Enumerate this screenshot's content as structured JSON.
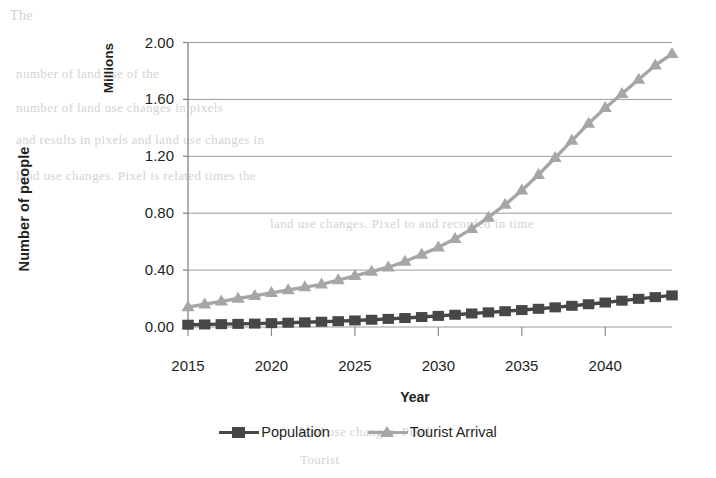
{
  "chart_data": {
    "type": "line",
    "title": "",
    "xlabel": "Year",
    "ylabel": "Number of people",
    "y_unit_label": "Millions",
    "xlim": [
      2015,
      2044
    ],
    "ylim": [
      0.0,
      2.0
    ],
    "grid": true,
    "legend_position": "bottom",
    "xticks": [
      2015,
      2020,
      2025,
      2030,
      2035,
      2040
    ],
    "xtick_labels": [
      "2015",
      "2020",
      "2025",
      "2030",
      "2035",
      "2040"
    ],
    "yticks": [
      0.0,
      0.4,
      0.8,
      1.2,
      1.6,
      2.0
    ],
    "ytick_labels": [
      "0.00",
      "0.40",
      "0.80",
      "1.20",
      "1.60",
      "2.00"
    ],
    "x": [
      2015,
      2016,
      2017,
      2018,
      2019,
      2020,
      2021,
      2022,
      2023,
      2024,
      2025,
      2026,
      2027,
      2028,
      2029,
      2030,
      2031,
      2032,
      2033,
      2034,
      2035,
      2036,
      2037,
      2038,
      2039,
      2040,
      2041,
      2042,
      2043,
      2044
    ],
    "series": [
      {
        "name": "Population",
        "marker": "square",
        "color": "#474747",
        "values": [
          0.016,
          0.018,
          0.02,
          0.022,
          0.024,
          0.027,
          0.03,
          0.033,
          0.037,
          0.041,
          0.046,
          0.051,
          0.057,
          0.063,
          0.07,
          0.078,
          0.086,
          0.095,
          0.103,
          0.111,
          0.119,
          0.128,
          0.138,
          0.149,
          0.16,
          0.172,
          0.185,
          0.198,
          0.21,
          0.222
        ]
      },
      {
        "name": "Tourist Arrival",
        "marker": "triangle",
        "color": "#a6a6a6",
        "values": [
          0.14,
          0.16,
          0.18,
          0.2,
          0.22,
          0.24,
          0.26,
          0.28,
          0.3,
          0.33,
          0.36,
          0.39,
          0.42,
          0.46,
          0.51,
          0.56,
          0.62,
          0.69,
          0.77,
          0.86,
          0.96,
          1.07,
          1.19,
          1.31,
          1.43,
          1.54,
          1.64,
          1.74,
          1.84,
          1.92
        ]
      }
    ]
  },
  "legend": {
    "entries": [
      {
        "label": "Population"
      },
      {
        "label": "Tourist Arrival"
      }
    ]
  },
  "colors": {
    "population": "#474747",
    "tourist_arrival": "#a6a6a6",
    "gridline": "#9a9a9a",
    "axis": "#8c8c8c",
    "text": "#231f20"
  },
  "background_text": [
    "The",
    "number of land use of the",
    "number of land use changes in pixels",
    "and results in pixels and land use changes in",
    "land use changes. Pixel is related times the",
    "land use changes. Pixel to and recorded in time",
    "land use changes. Pixel",
    "Tourist",
    "Tourist"
  ]
}
